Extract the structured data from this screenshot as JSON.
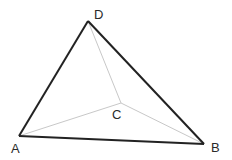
{
  "diagram": {
    "type": "tetrahedron",
    "vertices": {
      "A": {
        "label": "A",
        "x": 19,
        "y": 136,
        "lx": 11,
        "ly": 153
      },
      "B": {
        "label": "B",
        "x": 204,
        "y": 144,
        "lx": 211,
        "ly": 152
      },
      "C": {
        "label": "C",
        "x": 121,
        "y": 103,
        "lx": 112,
        "ly": 119
      },
      "D": {
        "label": "D",
        "x": 88,
        "y": 21,
        "lx": 94,
        "ly": 19
      }
    },
    "solid_edges": [
      "AD",
      "DB",
      "AB"
    ],
    "hidden_edges": [
      "AC",
      "BC",
      "DC"
    ],
    "colors": {
      "solid": "#222222",
      "hidden": "#c8c8c8"
    }
  }
}
